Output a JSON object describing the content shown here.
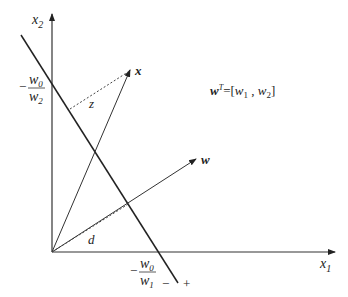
{
  "diagram": {
    "type": "geometry",
    "axes": {
      "x_label": "x",
      "x_sub": "1",
      "y_label": "x",
      "y_sub": "2"
    },
    "intercepts": {
      "y_intercept": {
        "sign": "−",
        "num": "w",
        "num_sub": "0",
        "den": "w",
        "den_sub": "2"
      },
      "x_intercept": {
        "sign": "−",
        "num": "w",
        "num_sub": "0",
        "den": "w",
        "den_sub": "1"
      }
    },
    "vectors": {
      "x": {
        "label": "x"
      },
      "w": {
        "label": "w"
      }
    },
    "distances": {
      "z": {
        "label": "z"
      },
      "d": {
        "label": "d"
      }
    },
    "region_signs": {
      "negative": "−",
      "positive": "+"
    },
    "equation": {
      "lhs": "w",
      "sup": "T",
      "eq": "=[",
      "w1": "w",
      "w1_sub": "1",
      "comma": " , ",
      "w2": "w",
      "w2_sub": "2",
      "close": "]"
    },
    "colors": {
      "line": "#222222",
      "background": "#ffffff"
    }
  }
}
